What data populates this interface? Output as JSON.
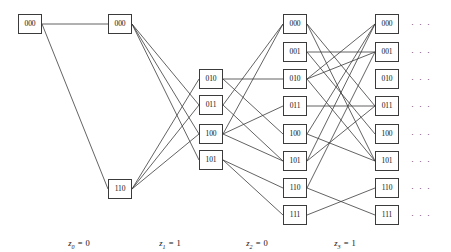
{
  "figure": {
    "name": "trellis-diagram",
    "background": "#ffffff",
    "edge_color": "#3b3b3b",
    "node_border_color": "#3b3b3b",
    "width": 451,
    "height": 252
  },
  "columns": [
    {
      "index": 0,
      "x": 30,
      "label": {
        "var": "z",
        "sub": "0",
        "eq": "=",
        "value": "0",
        "text": "z0 = 0",
        "x": 79,
        "y": 238
      },
      "nodes": [
        {
          "id": "c0n000",
          "label": "000",
          "x": 18,
          "y": 14,
          "w": 24,
          "h": 20,
          "cx": 30,
          "cy": 24
        }
      ]
    },
    {
      "index": 1,
      "x": 120,
      "label": {
        "var": "z",
        "sub": "1",
        "eq": "=",
        "value": "1",
        "text": "z1 = 1",
        "x": 170,
        "y": 238
      },
      "nodes": [
        {
          "id": "c1n000",
          "label": "000",
          "x": 108,
          "y": 14,
          "w": 24,
          "h": 20,
          "cx": 120,
          "cy": 24
        },
        {
          "id": "c1n110",
          "label": "110",
          "x": 108,
          "y": 179,
          "w": 24,
          "h": 20,
          "cx": 120,
          "cy": 189
        }
      ]
    },
    {
      "index": 2,
      "x": 211,
      "label": {
        "var": "z",
        "sub": "2",
        "eq": "=",
        "value": "0",
        "text": "z2 = 0",
        "x": 257,
        "y": 238
      },
      "nodes": [
        {
          "id": "c2n010",
          "label": "010",
          "x": 199,
          "y": 69,
          "w": 24,
          "h": 20,
          "cx": 211,
          "cy": 79
        },
        {
          "id": "c2n011",
          "label": "011",
          "x": 199,
          "y": 95,
          "w": 24,
          "h": 20,
          "cx": 211,
          "cy": 105
        },
        {
          "id": "c2n100",
          "label": "100",
          "x": 199,
          "y": 124,
          "w": 24,
          "h": 20,
          "cx": 211,
          "cy": 134
        },
        {
          "id": "c2n101",
          "label": "101",
          "x": 199,
          "y": 150,
          "w": 24,
          "h": 20,
          "cx": 211,
          "cy": 160
        }
      ]
    },
    {
      "index": 3,
      "x": 295,
      "label": {
        "var": "z",
        "sub": "3",
        "eq": "=",
        "value": "1",
        "text": "z3 = 1",
        "x": 345,
        "y": 238
      },
      "nodes": [
        {
          "id": "c3n000",
          "label": "000",
          "x": 283,
          "y": 14,
          "w": 24,
          "h": 20,
          "cx": 295,
          "cy": 24
        },
        {
          "id": "c3n001",
          "label": "001",
          "x": 283,
          "y": 42,
          "w": 24,
          "h": 20,
          "cx": 295,
          "cy": 52
        },
        {
          "id": "c3n010",
          "label": "010",
          "x": 283,
          "y": 69,
          "w": 24,
          "h": 20,
          "cx": 295,
          "cy": 79
        },
        {
          "id": "c3n011",
          "label": "011",
          "x": 283,
          "y": 96,
          "w": 24,
          "h": 20,
          "cx": 295,
          "cy": 106
        },
        {
          "id": "c3n100",
          "label": "100",
          "x": 283,
          "y": 124,
          "w": 24,
          "h": 20,
          "cx": 295,
          "cy": 134
        },
        {
          "id": "c3n101",
          "label": "101",
          "x": 283,
          "y": 151,
          "w": 24,
          "h": 20,
          "cx": 295,
          "cy": 161
        },
        {
          "id": "c3n110",
          "label": "110",
          "x": 283,
          "y": 178,
          "w": 24,
          "h": 20,
          "cx": 295,
          "cy": 188
        },
        {
          "id": "c3n111",
          "label": "111",
          "x": 283,
          "y": 205,
          "w": 24,
          "h": 20,
          "cx": 295,
          "cy": 215
        }
      ]
    },
    {
      "index": 4,
      "x": 387,
      "label": null,
      "nodes": [
        {
          "id": "c4n000",
          "label": "000",
          "x": 375,
          "y": 14,
          "w": 24,
          "h": 20,
          "cx": 387,
          "cy": 24
        },
        {
          "id": "c4n001",
          "label": "001",
          "x": 375,
          "y": 42,
          "w": 24,
          "h": 20,
          "cx": 387,
          "cy": 52
        },
        {
          "id": "c4n010",
          "label": "010",
          "x": 375,
          "y": 69,
          "w": 24,
          "h": 20,
          "cx": 387,
          "cy": 79
        },
        {
          "id": "c4n011",
          "label": "011",
          "x": 375,
          "y": 96,
          "w": 24,
          "h": 20,
          "cx": 387,
          "cy": 106
        },
        {
          "id": "c4n100",
          "label": "100",
          "x": 375,
          "y": 124,
          "w": 24,
          "h": 20,
          "cx": 387,
          "cy": 134
        },
        {
          "id": "c4n101",
          "label": "101",
          "x": 375,
          "y": 151,
          "w": 24,
          "h": 20,
          "cx": 387,
          "cy": 161
        },
        {
          "id": "c4n110",
          "label": "110",
          "x": 375,
          "y": 178,
          "w": 24,
          "h": 20,
          "cx": 387,
          "cy": 188
        },
        {
          "id": "c4n111",
          "label": "111",
          "x": 375,
          "y": 205,
          "w": 24,
          "h": 20,
          "cx": 387,
          "cy": 215
        }
      ]
    }
  ],
  "ellipses": [
    {
      "id": "ell000",
      "text": "· · ·",
      "x": 411,
      "y": 19
    },
    {
      "id": "ell001",
      "text": "· · ·",
      "x": 411,
      "y": 47
    },
    {
      "id": "ell010",
      "text": "· · ·",
      "x": 411,
      "y": 74
    },
    {
      "id": "ell011",
      "text": "· · ·",
      "x": 411,
      "y": 101
    },
    {
      "id": "ell100",
      "text": "· · ·",
      "x": 411,
      "y": 129
    },
    {
      "id": "ell101",
      "text": "· · ·",
      "x": 411,
      "y": 156
    },
    {
      "id": "ell110",
      "text": "· · ·",
      "x": 411,
      "y": 183
    },
    {
      "id": "ell111",
      "text": "· · ·",
      "x": 411,
      "y": 210
    }
  ],
  "edges": [
    {
      "from": "c0n000",
      "to": "c1n000"
    },
    {
      "from": "c0n000",
      "to": "c1n110"
    },
    {
      "from": "c1n000",
      "to": "c2n011"
    },
    {
      "from": "c1n000",
      "to": "c2n100"
    },
    {
      "from": "c1n000",
      "to": "c2n101"
    },
    {
      "from": "c1n110",
      "to": "c2n010"
    },
    {
      "from": "c1n110",
      "to": "c2n011"
    },
    {
      "from": "c1n110",
      "to": "c2n100"
    },
    {
      "from": "c2n010",
      "to": "c3n010"
    },
    {
      "from": "c2n010",
      "to": "c3n100"
    },
    {
      "from": "c2n011",
      "to": "c3n000"
    },
    {
      "from": "c2n011",
      "to": "c3n101"
    },
    {
      "from": "c2n100",
      "to": "c3n000"
    },
    {
      "from": "c2n100",
      "to": "c3n011"
    },
    {
      "from": "c2n100",
      "to": "c3n101"
    },
    {
      "from": "c2n101",
      "to": "c3n110"
    },
    {
      "from": "c2n101",
      "to": "c3n111"
    },
    {
      "from": "c3n000",
      "to": "c4n011"
    },
    {
      "from": "c3n000",
      "to": "c4n101"
    },
    {
      "from": "c3n001",
      "to": "c4n001"
    },
    {
      "from": "c3n001",
      "to": "c4n100"
    },
    {
      "from": "c3n010",
      "to": "c4n000"
    },
    {
      "from": "c3n010",
      "to": "c4n001"
    },
    {
      "from": "c3n010",
      "to": "c4n101"
    },
    {
      "from": "c3n011",
      "to": "c4n011"
    },
    {
      "from": "c3n100",
      "to": "c4n000"
    },
    {
      "from": "c3n100",
      "to": "c4n101"
    },
    {
      "from": "c3n101",
      "to": "c4n000"
    },
    {
      "from": "c3n101",
      "to": "c4n011"
    },
    {
      "from": "c3n110",
      "to": "c4n001"
    },
    {
      "from": "c3n110",
      "to": "c4n111"
    },
    {
      "from": "c3n111",
      "to": "c4n110"
    }
  ]
}
